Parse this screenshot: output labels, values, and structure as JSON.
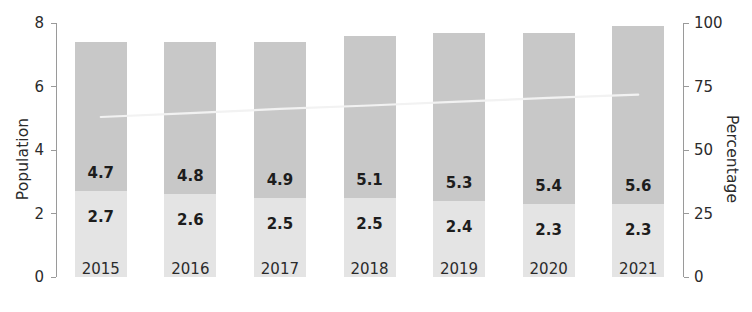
{
  "chart_data": {
    "type": "bar",
    "subtype": "stacked-bar-with-trendline",
    "title": "",
    "xlabel": "",
    "ylabel": "Population",
    "y2label": "Percentage",
    "categories": [
      "2015",
      "2016",
      "2017",
      "2018",
      "2019",
      "2020",
      "2021"
    ],
    "ylim": [
      0,
      8
    ],
    "y2lim": [
      0,
      100
    ],
    "yticks": [
      "0",
      "2",
      "4",
      "6",
      "8"
    ],
    "ytick_values": [
      0,
      2,
      4,
      6,
      8
    ],
    "y2ticks": [
      "0",
      "25",
      "50",
      "75",
      "100"
    ],
    "y2tick_values": [
      0,
      25,
      50,
      75,
      100
    ],
    "grid": false,
    "legend": null,
    "series": [
      {
        "name": "bottom-segment",
        "stack_position": "bottom",
        "color": "#e4e4e4",
        "axis": "left",
        "values": [
          2.7,
          2.6,
          2.5,
          2.5,
          2.4,
          2.3,
          2.3
        ],
        "labels": [
          "2.7",
          "2.6",
          "2.5",
          "2.5",
          "2.4",
          "2.3",
          "2.3"
        ]
      },
      {
        "name": "top-segment",
        "stack_position": "top",
        "color": "#c8c8c8",
        "axis": "left",
        "values": [
          4.7,
          4.8,
          4.9,
          5.1,
          5.3,
          5.4,
          5.6
        ],
        "labels": [
          "4.7",
          "4.8",
          "4.9",
          "5.1",
          "5.3",
          "5.4",
          "5.6"
        ]
      },
      {
        "name": "trend-line",
        "type": "line",
        "color": "#f2f2f2",
        "axis": "right",
        "values": [
          63.0,
          64.5,
          66.2,
          67.5,
          69.0,
          70.5,
          71.8
        ]
      }
    ],
    "totals": [
      7.4,
      7.4,
      7.4,
      7.6,
      7.7,
      7.7,
      7.9
    ]
  }
}
